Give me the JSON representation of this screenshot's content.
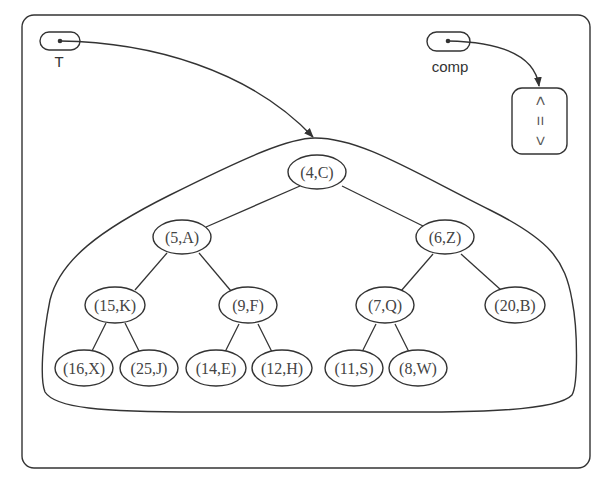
{
  "diagram": {
    "type": "heap-priority-queue",
    "variables": [
      {
        "id": "T",
        "label": "T",
        "points_to": "heap-tree"
      },
      {
        "id": "comp",
        "label": "comp",
        "points_to": "comparator"
      }
    ],
    "comparator": {
      "symbols": [
        "<",
        "=",
        ">"
      ],
      "orientation": "rotated-90"
    },
    "tree": {
      "nodes": [
        {
          "id": "n0",
          "label": "(4,C)",
          "x": 317,
          "y": 172
        },
        {
          "id": "n1",
          "label": "(5,A)",
          "x": 182,
          "y": 237
        },
        {
          "id": "n2",
          "label": "(6,Z)",
          "x": 445,
          "y": 237
        },
        {
          "id": "n3",
          "label": "(15,K)",
          "x": 115,
          "y": 305
        },
        {
          "id": "n4",
          "label": "(9,F)",
          "x": 248,
          "y": 305
        },
        {
          "id": "n5",
          "label": "(7,Q)",
          "x": 385,
          "y": 305
        },
        {
          "id": "n6",
          "label": "(20,B)",
          "x": 515,
          "y": 305
        },
        {
          "id": "n7",
          "label": "(16,X)",
          "x": 84,
          "y": 368
        },
        {
          "id": "n8",
          "label": "(25,J)",
          "x": 149,
          "y": 368
        },
        {
          "id": "n9",
          "label": "(14,E)",
          "x": 216,
          "y": 368
        },
        {
          "id": "n10",
          "label": "(12,H)",
          "x": 282,
          "y": 368
        },
        {
          "id": "n11",
          "label": "(11,S)",
          "x": 354,
          "y": 368
        },
        {
          "id": "n12",
          "label": "(8,W)",
          "x": 418,
          "y": 368
        }
      ],
      "edges": [
        [
          "n0",
          "n1"
        ],
        [
          "n0",
          "n2"
        ],
        [
          "n1",
          "n3"
        ],
        [
          "n1",
          "n4"
        ],
        [
          "n2",
          "n5"
        ],
        [
          "n2",
          "n6"
        ],
        [
          "n3",
          "n7"
        ],
        [
          "n3",
          "n8"
        ],
        [
          "n4",
          "n9"
        ],
        [
          "n4",
          "n10"
        ],
        [
          "n5",
          "n11"
        ],
        [
          "n5",
          "n12"
        ]
      ]
    }
  }
}
